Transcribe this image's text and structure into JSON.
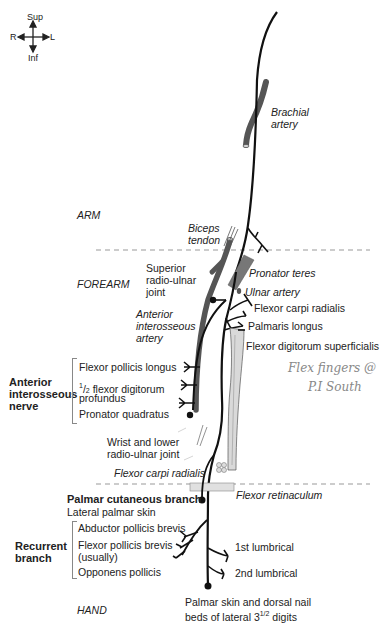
{
  "compass": {
    "sup": "Sup",
    "inf": "Inf",
    "right": "R",
    "left": "L"
  },
  "regions": {
    "arm": "ARM",
    "forearm": "FOREARM",
    "hand": "HAND"
  },
  "structures": {
    "brachial_artery_1": "Brachial",
    "brachial_artery_2": "artery",
    "biceps_tendon_1": "Biceps",
    "biceps_tendon_2": "tendon",
    "superior_ru_joint_1": "Superior",
    "superior_ru_joint_2": "radio-ulnar",
    "superior_ru_joint_3": "joint",
    "anterior_interosseous_artery_1": "Anterior",
    "anterior_interosseous_artery_2": "interosseous",
    "anterior_interosseous_artery_3": "artery",
    "pronator_teres": "Pronator teres",
    "ulnar_artery": "Ulnar artery",
    "flexor_carpi_radialis": "Flexor carpi radialis",
    "palmaris_longus": "Palmaris longus",
    "flexor_digitorum_superficialis": "Flexor digitorum superficialis",
    "wrist_joint_1": "Wrist and lower",
    "wrist_joint_2": "radio-ulnar joint",
    "flexor_carpi_radialis_tendon": "Flexor carpi radialis",
    "flexor_retinaculum": "Flexor retinaculum"
  },
  "anterior_interosseous_nerve": {
    "title_1": "Anterior",
    "title_2": "interosseous",
    "title_3": "nerve",
    "branches": {
      "fpl": "Flexor pollicis longus",
      "fdp_frac_num": "1",
      "fdp_frac_den": "2",
      "fdp_1": " flexor digitorum",
      "fdp_2": "profundus",
      "pq": "Pronator quadratus"
    }
  },
  "palmar_cutaneous_branch": {
    "title": "Palmar cutaneous branch",
    "target": "Lateral palmar skin"
  },
  "recurrent_branch": {
    "title_1": "Recurrent",
    "title_2": "branch",
    "branches": {
      "apb": "Abductor pollicis brevis",
      "fpb_1": "Flexor pollicis brevis",
      "fpb_2": "(usually)",
      "op": "Opponens pollicis"
    }
  },
  "hand_branches": {
    "lumbrical_1": "1st lumbrical",
    "lumbrical_2": "2nd lumbrical",
    "digital_1": "Palmar skin and dorsal nail",
    "digital_2_pre": "beds of lateral 3",
    "digital_2_frac": "1/2",
    "digital_2_post": " digits"
  },
  "handwritten_note": {
    "line_1": "Flex fingers @",
    "line_2": "P.I South"
  },
  "colors": {
    "nerve": "#111111",
    "artery": "#555555",
    "muscle_band": "#d9d9d9",
    "divider": "#999999"
  }
}
